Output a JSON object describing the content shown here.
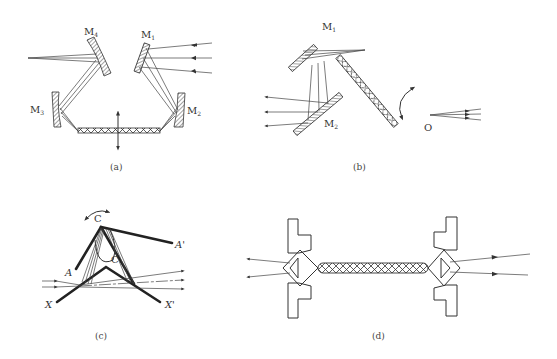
{
  "figure": {
    "stroke_color": "#333333",
    "background": "#ffffff"
  },
  "panels": {
    "a": {
      "caption": "(a)",
      "labels": {
        "m4": "M",
        "m4_sub": "4",
        "m1": "M",
        "m1_sub": "1",
        "m3": "M",
        "m3_sub": "3",
        "m2": "M",
        "m2_sub": "2"
      }
    },
    "b": {
      "caption": "(b)",
      "labels": {
        "m1": "M",
        "m1_sub": "1",
        "m2": "M",
        "m2_sub": "2",
        "o": "O"
      }
    },
    "c": {
      "caption": "(c)",
      "labels": {
        "c_top": "C",
        "c_inner": "C",
        "a": "A",
        "a_prime": "A'",
        "x": "X",
        "x_prime": "X'"
      }
    },
    "d": {
      "caption": "(d)"
    }
  }
}
